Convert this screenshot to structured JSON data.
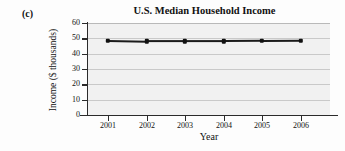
{
  "figure": {
    "part_label": "(c)",
    "background_color": "#fdfdfd",
    "plot_background_color": "#f1f1f1",
    "gridline_color": "#c9c9c9",
    "series_color": "#1a1a1a"
  },
  "chart_data": {
    "type": "line",
    "title": "U.S. Median Household Income",
    "xlabel": "Year",
    "ylabel": "Income ($ thousands)",
    "categories": [
      "2001",
      "2002",
      "2003",
      "2004",
      "2005",
      "2006"
    ],
    "x": [
      2001,
      2002,
      2003,
      2004,
      2005,
      2006
    ],
    "values": [
      48.5,
      48.0,
      48.0,
      48.0,
      48.2,
      48.5
    ],
    "series": [
      {
        "name": "U.S. Median Household Income",
        "values": [
          48.5,
          48.0,
          48.0,
          48.0,
          48.2,
          48.5
        ]
      }
    ],
    "ylim": [
      0,
      60
    ],
    "yticks": [
      0,
      10,
      20,
      30,
      40,
      50,
      60
    ],
    "ytick_labels": [
      "0",
      "10",
      "20",
      "30",
      "40",
      "50",
      "60"
    ],
    "xtick_labels": [
      "2001",
      "2002",
      "2003",
      "2004",
      "2005",
      "2006"
    ],
    "grid": true,
    "grid_axis": "y",
    "legend": false,
    "legend_position": "none",
    "marker": "square"
  }
}
